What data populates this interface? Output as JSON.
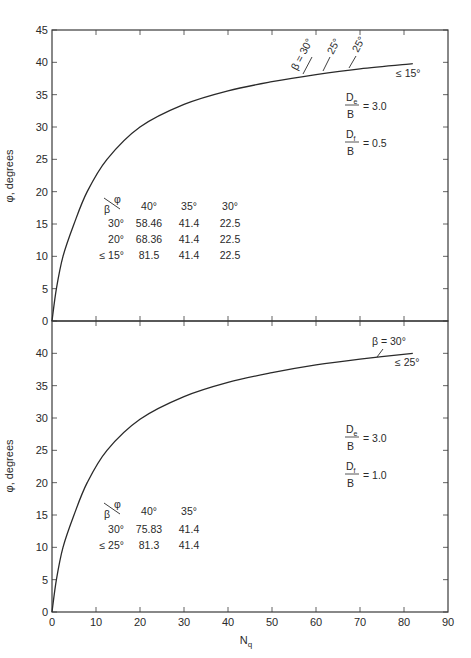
{
  "chart_data": [
    {
      "type": "line",
      "panel": "top",
      "title": "",
      "xlabel": "",
      "ylabel": "φ, degrees",
      "xlim": [
        0,
        90
      ],
      "ylim": [
        0,
        45
      ],
      "yticks": [
        0,
        5,
        10,
        15,
        20,
        25,
        30,
        35,
        40,
        45
      ],
      "xticks": [
        0,
        10,
        20,
        30,
        40,
        50,
        60,
        70,
        80,
        90
      ],
      "grid": false,
      "series": [
        {
          "name": "φ vs Nq",
          "x": [
            0,
            1,
            2.5,
            5,
            8,
            12.5,
            20,
            30,
            40,
            50,
            60,
            70,
            82
          ],
          "y": [
            0,
            5,
            10,
            15,
            20,
            25,
            30,
            33.5,
            35.6,
            37,
            38.1,
            39,
            39.8
          ]
        }
      ],
      "curve_labels": [
        {
          "text": "β = 30°",
          "at_Nq": 58
        },
        {
          "text": "25°",
          "at_Nq": 63
        },
        {
          "text": "25°",
          "at_Nq": 69
        },
        {
          "text": "≤ 15°",
          "at_Nq": 80
        }
      ],
      "parameters": {
        "De_over_B": "3.0",
        "Df_over_B": "0.5"
      },
      "table": {
        "header_corner_top": "φ",
        "header_corner_bottom": "β",
        "columns": [
          "40°",
          "35°",
          "30°"
        ],
        "rows": [
          {
            "beta": "30°",
            "values": [
              "58.46",
              "41.4",
              "22.5"
            ]
          },
          {
            "beta": "20°",
            "values": [
              "68.36",
              "41.4",
              "22.5"
            ]
          },
          {
            "beta": "≤ 15°",
            "values": [
              "81.5",
              "41.4",
              "22.5"
            ]
          }
        ]
      }
    },
    {
      "type": "line",
      "panel": "bottom",
      "title": "",
      "xlabel": "Nq",
      "ylabel": "φ, degrees",
      "xlim": [
        0,
        90
      ],
      "ylim": [
        0,
        45
      ],
      "yticks": [
        0,
        5,
        10,
        15,
        20,
        25,
        30,
        35,
        40
      ],
      "xticks": [
        0,
        10,
        20,
        30,
        40,
        50,
        60,
        70,
        80,
        90
      ],
      "grid": false,
      "series": [
        {
          "name": "φ vs Nq",
          "x": [
            0,
            1,
            2.5,
            5,
            8,
            12.5,
            20,
            30,
            40,
            50,
            60,
            70,
            82
          ],
          "y": [
            0,
            5,
            10,
            15,
            20,
            25,
            29.8,
            33.3,
            35.5,
            37,
            38.2,
            39.1,
            40
          ]
        }
      ],
      "curve_labels": [
        {
          "text": "β = 30°",
          "at_Nq": 74
        },
        {
          "text": "≤ 25°",
          "at_Nq": 80
        }
      ],
      "parameters": {
        "De_over_B": "3.0",
        "Df_over_B": "1.0"
      },
      "table": {
        "header_corner_top": "φ",
        "header_corner_bottom": "β",
        "columns": [
          "40°",
          "35°"
        ],
        "rows": [
          {
            "beta": "30°",
            "values": [
              "75.83",
              "41.4"
            ]
          },
          {
            "beta": "≤ 25°",
            "values": [
              "81.3",
              "41.4"
            ]
          }
        ]
      }
    }
  ],
  "labels": {
    "ylabel": "φ, degrees",
    "xlabel_main": "N",
    "xlabel_sub": "q",
    "D": "D",
    "sub_e": "e",
    "sub_f": "f",
    "B": "B",
    "eq_top_de": "= 3.0",
    "eq_top_df": "= 0.5",
    "eq_bot_de": "= 3.0",
    "eq_bot_df": "= 1.0",
    "top_beta30": "β = 30°",
    "top_25a": "25°",
    "top_25b": "25°",
    "top_le15": "≤ 15°",
    "bot_beta30": "β = 30°",
    "bot_le25": "≤ 25°",
    "phi": "φ",
    "beta": "β"
  },
  "style": {
    "line_color": "#2a2a2a",
    "axis_color": "#3a3a3a",
    "background": "#ffffff"
  }
}
